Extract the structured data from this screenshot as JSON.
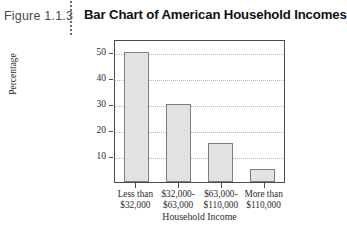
{
  "figure": {
    "caption": "Figure 1.1.3",
    "title": "Bar Chart of American Household Incomes",
    "separator_icon": "vertical-dotted-rule"
  },
  "chart_data": {
    "type": "bar",
    "title": "Bar Chart of American Household Incomes",
    "categories": [
      "Less than $32,000",
      "$32,000-$63,000",
      "$63,000-$110,000",
      "More than $110,000"
    ],
    "category_lines": [
      [
        "Less than",
        "$32,000"
      ],
      [
        "$32,000-",
        "$63,000"
      ],
      [
        "$63,000-",
        "$110,000"
      ],
      [
        "More than",
        "$110,000"
      ]
    ],
    "values": [
      50,
      30,
      15,
      5
    ],
    "xlabel": "Household Income",
    "ylabel": "Percentage",
    "ylim": [
      0,
      55
    ],
    "yticks": [
      10,
      20,
      30,
      40,
      50
    ],
    "ytick_labels": [
      "10",
      "20",
      "30",
      "40",
      "50"
    ],
    "grid": "horizontal-dotted",
    "legend": "none",
    "bar_fill": "#e2e2e2",
    "bar_border": "#7e7e7e",
    "frame_color": "#4c4c4c",
    "gridline_color": "#b9b9b9"
  }
}
